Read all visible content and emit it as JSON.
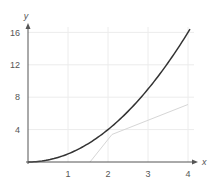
{
  "chart_data": {
    "type": "line",
    "title": "",
    "xlabel": "x",
    "ylabel": "y",
    "xlim": [
      0,
      4
    ],
    "ylim": [
      0,
      17
    ],
    "grid": true,
    "x_ticks": [
      "1",
      "2",
      "3",
      "4"
    ],
    "y_ticks": [
      "4",
      "8",
      "12",
      "16"
    ],
    "series": [
      {
        "name": "curve",
        "style": "dark",
        "color": "#333333",
        "x": [
          0,
          0.5,
          1,
          1.5,
          2,
          2.5,
          3,
          3.5,
          4,
          4.05
        ],
        "y": [
          0,
          0.25,
          1,
          2.25,
          4,
          6.25,
          9,
          12.25,
          16,
          16.4
        ]
      },
      {
        "name": "light-line",
        "style": "light",
        "color": "#d6d6d6",
        "x": [
          1.55,
          2.1,
          4
        ],
        "y": [
          0,
          3.4,
          7.1
        ]
      }
    ]
  },
  "axes": {
    "x_label": "x",
    "y_label": "y",
    "x_tick_labels": [
      "1",
      "2",
      "3",
      "4"
    ],
    "y_tick_labels": [
      "4",
      "8",
      "12",
      "16"
    ]
  },
  "colors": {
    "axis": "#555555",
    "grid": "#ececec",
    "curve": "#333333",
    "light_line": "#d6d6d6"
  }
}
